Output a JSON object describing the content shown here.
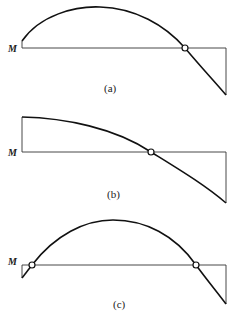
{
  "diagrams": [
    {
      "id": "a",
      "caption": "(a)",
      "axis_label": "M",
      "description": "Moment diagram: small positive start, parabolic hump, one inflection point, ends negative"
    },
    {
      "id": "b",
      "caption": "(b)",
      "axis_label": "M",
      "description": "Moment diagram: large positive start, decreasing curve, one inflection point, ends negative"
    },
    {
      "id": "c",
      "caption": "(c)",
      "axis_label": "M",
      "description": "Moment diagram: small negative start, two inflection points with positive hump between, ends negative"
    }
  ]
}
